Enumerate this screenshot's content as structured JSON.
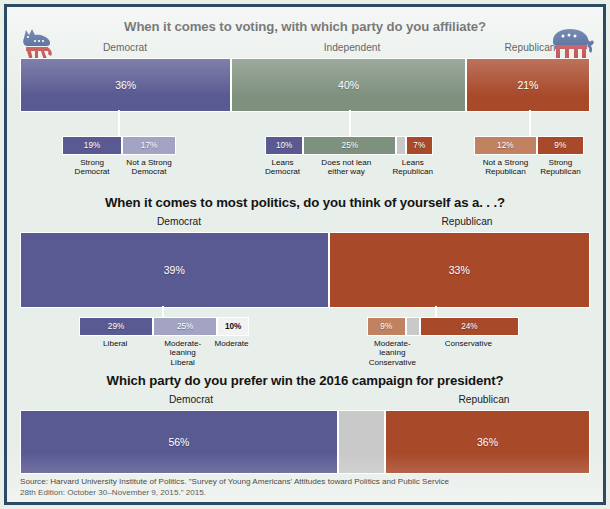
{
  "poster": {
    "background_color": "#e8eeea",
    "border_color": "#2c4a63"
  },
  "colors": {
    "democrat_dark": "#5a5a93",
    "democrat_light": "#a3a3c4",
    "independent_green": "#7e917f",
    "republican_dark": "#a8492a",
    "republican_light": "#c08260",
    "neutral_gray": "#c9c9c9",
    "moderate_white": "#f2f2f2",
    "bar_outline": "#ffffff"
  },
  "mascots": {
    "left": "democratic-donkey-logo",
    "right": "republican-elephant-logo"
  },
  "sections": [
    {
      "id": "affiliation",
      "title": "When it comes to voting, with which party do you affiliate?",
      "groups": [
        {
          "label": "Democrat",
          "value": "36%",
          "value_num": 36,
          "color": "#5a5a93"
        },
        {
          "label": "Independent",
          "value": "40%",
          "value_num": 40,
          "color": "#7e917f"
        },
        {
          "label": "Republican",
          "value": "21%",
          "value_num": 21,
          "color": "#a8492a"
        }
      ],
      "sub_groups": [
        {
          "parent": "Democrat",
          "segments": [
            {
              "value": "19%",
              "value_num": 19,
              "label": "Strong Democrat",
              "label_lines": [
                "Strong",
                "Democrat"
              ],
              "color": "#5a5a93",
              "text": "light"
            },
            {
              "value": "17%",
              "value_num": 17,
              "label": "Not a Strong Democrat",
              "label_lines": [
                "Not a Strong",
                "Democrat"
              ],
              "color": "#a3a3c4",
              "text": "light"
            }
          ]
        },
        {
          "parent": "Independent",
          "segments": [
            {
              "value": "10%",
              "value_num": 10,
              "label": "Leans Democrat",
              "label_lines": [
                "Leans",
                "Democrat"
              ],
              "color": "#5a5a93",
              "text": "light"
            },
            {
              "value": "25%",
              "value_num": 25,
              "label": "Does not lean either way",
              "label_lines": [
                "Does not lean",
                "either way"
              ],
              "color": "#7e917f",
              "text": "light"
            },
            {
              "value": "",
              "value_num": 2,
              "label": "",
              "label_lines": [],
              "color": "#c9c9c9",
              "text": "light"
            },
            {
              "value": "7%",
              "value_num": 7,
              "label": "Leans Republican",
              "label_lines": [
                "Leans",
                "Republican"
              ],
              "color": "#a8492a",
              "text": "light"
            }
          ]
        },
        {
          "parent": "Republican",
          "segments": [
            {
              "value": "12%",
              "value_num": 12,
              "label": "Not a Strong Republican",
              "label_lines": [
                "Not a Strong",
                "Republican"
              ],
              "color": "#c08260",
              "text": "light"
            },
            {
              "value": "9%",
              "value_num": 9,
              "label": "Strong Republican",
              "label_lines": [
                "Strong",
                "Republican"
              ],
              "color": "#a8492a",
              "text": "light"
            }
          ]
        }
      ]
    },
    {
      "id": "ideology",
      "title": "When it comes to most politics, do you think of yourself as a. . .?",
      "groups": [
        {
          "label": "Democrat",
          "value": "39%",
          "value_num": 39,
          "color": "#5a5a93"
        },
        {
          "label": "Republican",
          "value": "33%",
          "value_num": 33,
          "color": "#a8492a"
        }
      ],
      "sub_groups": [
        {
          "parent": "Democrat",
          "segments": [
            {
              "value": "29%",
              "value_num": 29,
              "label": "Liberal",
              "label_lines": [
                "Liberal"
              ],
              "color": "#5a5a93",
              "text": "light"
            },
            {
              "value": "25%",
              "value_num": 25,
              "label": "Moderate-leaning Liberal",
              "label_lines": [
                "Moderate-leaning",
                "Liberal"
              ],
              "color": "#a3a3c4",
              "text": "light"
            },
            {
              "value": "10%",
              "value_num": 10,
              "label": "Moderate",
              "label_lines": [
                "Moderate"
              ],
              "color": "#f2f2f2",
              "text": "dark"
            }
          ]
        },
        {
          "parent": "Republican",
          "segments": [
            {
              "value": "9%",
              "value_num": 9,
              "label": "Moderate-leaning Conservative",
              "label_lines": [
                "Moderate-leaning",
                "Conservative"
              ],
              "color": "#c08260",
              "text": "light"
            },
            {
              "value": "",
              "value_num": 3,
              "label": "",
              "label_lines": [],
              "color": "#c9c9c9",
              "text": "light"
            },
            {
              "value": "24%",
              "value_num": 24,
              "label": "Conservative",
              "label_lines": [
                "Conservative"
              ],
              "color": "#a8492a",
              "text": "light"
            }
          ]
        }
      ]
    },
    {
      "id": "preference2016",
      "title": "Which party do you prefer win the 2016 campaign for president?",
      "groups": [
        {
          "label": "Democrat",
          "value": "56%",
          "value_num": 56,
          "color": "#5a5a93"
        },
        {
          "label": "",
          "value": "",
          "value_num": 8,
          "color": "#c9c9c9"
        },
        {
          "label": "Republican",
          "value": "36%",
          "value_num": 36,
          "color": "#a8492a"
        }
      ],
      "sub_groups": []
    }
  ],
  "footer": {
    "line1": "Source: Harvard University Institute of Politics. \"Survey of Young Americans' Attitudes toward Politics and Public Service",
    "line2": "28th Edition: October 30–November 9, 2015.\" 2015."
  }
}
